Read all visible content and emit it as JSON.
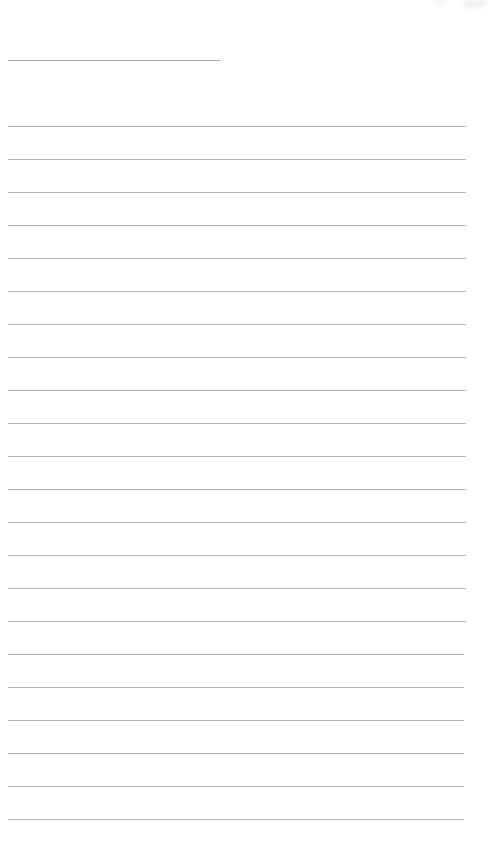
{
  "page": {
    "type": "lined-notepaper",
    "title": "",
    "line_color": "#b4b4b4",
    "background": "#ffffff",
    "title_line": {
      "x": 8,
      "y": 60,
      "width": 212
    },
    "rules": {
      "count": 22,
      "start_y": 126,
      "spacing": 33,
      "x": 8,
      "width": 458
    },
    "lines_text": [
      "",
      "",
      "",
      "",
      "",
      "",
      "",
      "",
      "",
      "",
      "",
      "",
      "",
      "",
      "",
      "",
      "",
      "",
      "",
      "",
      "",
      ""
    ]
  }
}
